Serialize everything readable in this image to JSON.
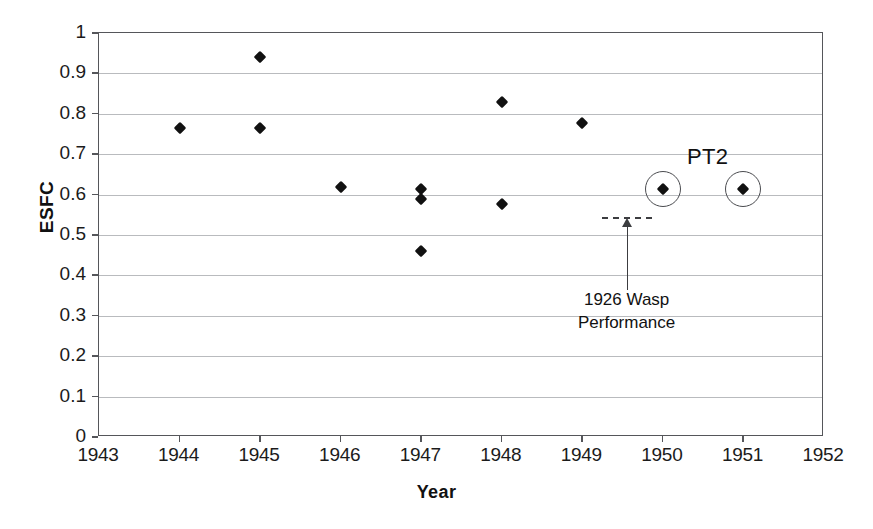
{
  "chart_data": {
    "type": "scatter",
    "title": "",
    "xlabel": "Year",
    "ylabel": "ESFC",
    "xlim": [
      1943,
      1952
    ],
    "ylim": [
      0,
      1
    ],
    "grid": true,
    "legend": "none",
    "x_ticks": [
      "1943",
      "1944",
      "1945",
      "1946",
      "1947",
      "1948",
      "1949",
      "1950",
      "1951",
      "1952"
    ],
    "y_ticks": [
      "0",
      "0.1",
      "0.2",
      "0.3",
      "0.4",
      "0.5",
      "0.6",
      "0.7",
      "0.8",
      "0.9",
      "1"
    ],
    "points": [
      {
        "x": 1944.0,
        "y": 0.765,
        "highlighted": false
      },
      {
        "x": 1945.0,
        "y": 0.94,
        "highlighted": false
      },
      {
        "x": 1945.0,
        "y": 0.765,
        "highlighted": false
      },
      {
        "x": 1946.0,
        "y": 0.618,
        "highlighted": false
      },
      {
        "x": 1947.0,
        "y": 0.613,
        "highlighted": false
      },
      {
        "x": 1947.0,
        "y": 0.59,
        "highlighted": false
      },
      {
        "x": 1947.0,
        "y": 0.46,
        "highlighted": false
      },
      {
        "x": 1948.0,
        "y": 0.828,
        "highlighted": false
      },
      {
        "x": 1948.0,
        "y": 0.577,
        "highlighted": false
      },
      {
        "x": 1949.0,
        "y": 0.778,
        "highlighted": false
      },
      {
        "x": 1950.0,
        "y": 0.615,
        "highlighted": true
      },
      {
        "x": 1951.0,
        "y": 0.615,
        "highlighted": true
      }
    ],
    "annotations": [
      {
        "id": "pt2",
        "text": "PT2",
        "x": 1950.3,
        "y": 0.69
      },
      {
        "id": "wasp",
        "line1": "1926 Wasp",
        "line2": "Performance",
        "reference_value": 0.545,
        "ref_x_start": 1949.25,
        "ref_x_end": 1949.87,
        "text_x": 1949.55,
        "text_y": 0.345
      }
    ],
    "colors": {
      "marker": "#111111",
      "gridline": "#b9bbbe",
      "axis": "#55565a",
      "text": "#111111",
      "annotation": "#3c3d40"
    }
  }
}
